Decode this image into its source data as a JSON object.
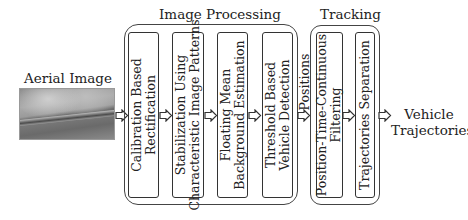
{
  "input": {
    "label": "Aerial Image",
    "image_icon": "aerial-photo"
  },
  "groups": {
    "image_processing": {
      "label": "Image Processing",
      "stages": [
        {
          "lines": [
            "Calibration Based",
            "Rectification"
          ]
        },
        {
          "lines": [
            "Stabilization Using",
            "Characteristic Image Patterns"
          ]
        },
        {
          "lines": [
            "Floating Mean",
            "Background Estimation"
          ]
        },
        {
          "lines": [
            "Threshold Based",
            "Vehicle Detection"
          ]
        }
      ]
    },
    "intermediate": {
      "label": "Positions"
    },
    "tracking": {
      "label": "Tracking",
      "stages": [
        {
          "lines": [
            "Position-Time-Continuous",
            "Filtering"
          ]
        },
        {
          "lines": [
            "Trajectories Separation"
          ]
        }
      ]
    }
  },
  "output": {
    "lines": [
      "Vehicle",
      "Trajectories"
    ]
  },
  "colors": {
    "stroke": "#333333",
    "background": "#ffffff",
    "text": "#222222"
  }
}
